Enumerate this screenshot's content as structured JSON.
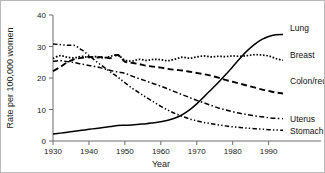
{
  "chart_data": {
    "type": "line",
    "title": "",
    "xlabel": "Year",
    "ylabel": "Rate per 100,000 women",
    "xlim": [
      1930,
      1994
    ],
    "ylim": [
      0,
      40
    ],
    "xticks": [
      1930,
      1940,
      1950,
      1960,
      1970,
      1980,
      1990
    ],
    "xticklabels": [
      "1930",
      "1940",
      "1950",
      "1960",
      "1970",
      "1980",
      "1990"
    ],
    "yticks": [
      0,
      10,
      20,
      30,
      40
    ],
    "yticklabels": [
      "0",
      "10",
      "20",
      "30",
      "40"
    ],
    "grid": false,
    "legend_position": "right-inline-labels",
    "x": [
      1930,
      1932,
      1934,
      1936,
      1938,
      1940,
      1942,
      1944,
      1946,
      1948,
      1950,
      1952,
      1954,
      1956,
      1958,
      1960,
      1962,
      1964,
      1966,
      1968,
      1970,
      1972,
      1974,
      1976,
      1978,
      1980,
      1982,
      1984,
      1986,
      1988,
      1990,
      1992,
      1994
    ],
    "series": [
      {
        "name": "Lung",
        "label": "Lung",
        "dash": "solid",
        "values": [
          2.2,
          2.5,
          2.8,
          3.1,
          3.4,
          3.7,
          4.0,
          4.3,
          4.6,
          4.9,
          5.0,
          5.1,
          5.3,
          5.5,
          5.8,
          6.1,
          6.6,
          7.3,
          8.4,
          9.9,
          11.8,
          14.0,
          16.3,
          18.6,
          21.0,
          23.6,
          26.2,
          28.6,
          30.6,
          32.2,
          33.2,
          33.7,
          33.8
        ]
      },
      {
        "name": "Breast",
        "label": "Breast",
        "dash": "dotted",
        "values": [
          26.2,
          27.1,
          26.6,
          26.4,
          26.9,
          26.5,
          26.8,
          26.4,
          26.9,
          27.3,
          25.7,
          25.4,
          25.9,
          25.6,
          25.9,
          25.8,
          25.5,
          26.0,
          26.6,
          26.3,
          26.7,
          27.0,
          26.7,
          26.9,
          26.8,
          27.0,
          26.9,
          27.1,
          27.4,
          27.3,
          27.0,
          26.2,
          25.6
        ]
      },
      {
        "name": "Colon/rectum",
        "label": "Colon/rectum",
        "dash": "long-dash",
        "values": [
          22.2,
          23.5,
          25.0,
          26.0,
          26.4,
          26.7,
          26.5,
          26.7,
          26.3,
          27.3,
          25.2,
          24.8,
          24.4,
          23.9,
          23.6,
          23.3,
          22.9,
          22.6,
          22.4,
          22.0,
          21.6,
          21.2,
          20.7,
          20.1,
          19.4,
          18.8,
          18.2,
          17.6,
          17.0,
          16.4,
          15.9,
          15.4,
          15.1
        ]
      },
      {
        "name": "Uterus",
        "label": "Uterus",
        "dash": "dash-dot",
        "values": [
          25.3,
          25.5,
          25.2,
          24.9,
          24.4,
          24.0,
          23.6,
          23.0,
          22.4,
          21.9,
          21.5,
          20.6,
          19.8,
          19.0,
          18.2,
          17.4,
          16.5,
          15.6,
          14.7,
          13.8,
          12.9,
          12.1,
          11.3,
          10.5,
          9.9,
          9.3,
          8.8,
          8.4,
          8.0,
          7.7,
          7.4,
          7.2,
          7.1
        ]
      },
      {
        "name": "Stomach",
        "label": "Stomach",
        "dash": "dash-dot-dot",
        "values": [
          30.8,
          30.6,
          30.4,
          30.3,
          28.9,
          27.2,
          25.3,
          23.6,
          21.9,
          20.3,
          18.5,
          16.8,
          15.3,
          13.8,
          12.4,
          11.0,
          9.8,
          8.7,
          7.8,
          7.0,
          6.4,
          5.9,
          5.5,
          5.1,
          4.8,
          4.5,
          4.3,
          4.1,
          3.9,
          3.8,
          3.6,
          3.5,
          3.4
        ]
      }
    ]
  }
}
